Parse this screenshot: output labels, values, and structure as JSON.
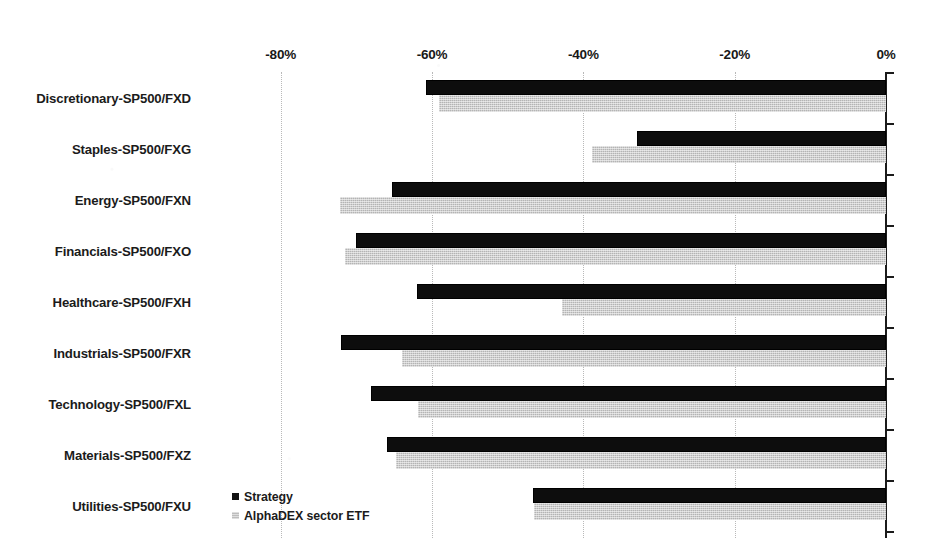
{
  "chart_data": {
    "type": "bar",
    "orientation": "horizontal",
    "title": "",
    "xlabel": "",
    "ylabel": "",
    "xlim": [
      -90,
      0
    ],
    "xtick_values": [
      -80,
      -60,
      -40,
      -20,
      0
    ],
    "xtick_labels": [
      "-80%",
      "-60%",
      "-40%",
      "-20%",
      "0%"
    ],
    "grid": true,
    "grid_axis": "x",
    "legend_position": "bottom-left-inside",
    "categories": [
      "Discretionary-SP500/FXD",
      "Staples-SP500/FXG",
      "Energy-SP500/FXN",
      "Financials-SP500/FXO",
      "Healthcare-SP500/FXH",
      "Industrials-SP500/FXR",
      "Technology-SP500/FXL",
      "Materials-SP500/FXZ",
      "Utilities-SP500/FXU"
    ],
    "series": [
      {
        "name": "Strategy",
        "color": "#0d0d0d",
        "values": [
          -60.8,
          -32.9,
          -65.3,
          -70.0,
          -62.0,
          -72.0,
          -68.0,
          -65.9,
          -46.6
        ]
      },
      {
        "name": "AlphaDEX sector ETF",
        "color": "#b4b4b4",
        "values": [
          -59.1,
          -38.8,
          -72.1,
          -71.5,
          -42.8,
          -63.9,
          -61.8,
          -64.7,
          -46.5
        ]
      }
    ]
  },
  "legend": {
    "items": [
      {
        "label": "Strategy",
        "swatch": "strategy"
      },
      {
        "label": "AlphaDEX sector ETF",
        "swatch": "etf"
      }
    ]
  }
}
